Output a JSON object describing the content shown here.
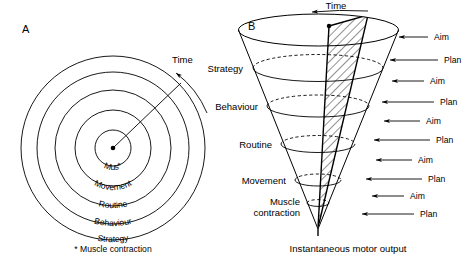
{
  "figure": {
    "background_color": "#ffffff",
    "ink_color": "#000000",
    "panels": [
      {
        "letter": "A",
        "type": "concentric-circles",
        "time_label": "Time",
        "center_label": "Mus*",
        "footnote": "* Muscle contraction",
        "rings": [
          {
            "label": "Mus*",
            "radius": 18
          },
          {
            "label": "Movement",
            "radius": 38
          },
          {
            "label": "Routine",
            "radius": 58
          },
          {
            "label": "Behaviour",
            "radius": 76
          },
          {
            "label": "Strategy",
            "radius": 92
          }
        ]
      },
      {
        "letter": "B",
        "type": "inverted-cone",
        "time_label": "Time",
        "caption": "Instantaneous motor output",
        "levels": [
          {
            "label": "Strategy"
          },
          {
            "label": "Behaviour"
          },
          {
            "label": "Routine"
          },
          {
            "label": "Movement"
          },
          {
            "label": "Muscle",
            "label2": "contraction"
          }
        ],
        "arrows": [
          {
            "label": "Aim"
          },
          {
            "label": "Plan"
          },
          {
            "label": "Aim"
          },
          {
            "label": "Plan"
          },
          {
            "label": "Aim"
          },
          {
            "label": "Plan"
          },
          {
            "label": "Aim"
          },
          {
            "label": "Plan"
          },
          {
            "label": "Aim"
          },
          {
            "label": "Plan"
          }
        ]
      }
    ]
  }
}
